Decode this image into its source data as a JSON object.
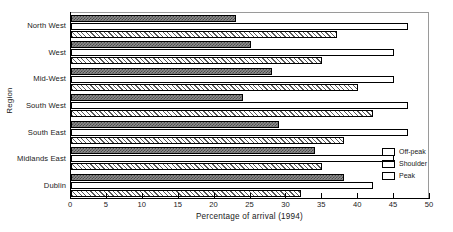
{
  "chart_data": {
    "type": "bar",
    "orientation": "horizontal",
    "title": "",
    "xlabel": "Percentage of arrival (1994)",
    "ylabel": "Region",
    "xlim": [
      0,
      50
    ],
    "xticks": [
      0,
      5,
      10,
      15,
      20,
      25,
      30,
      35,
      40,
      45,
      50
    ],
    "grid": false,
    "legend_position": "bottom-right",
    "categories": [
      "North West",
      "West",
      "Mid-West",
      "South West",
      "South East",
      "Midlands East",
      "Dublin"
    ],
    "series": [
      {
        "name": "Off-peak",
        "fill": "dark-checker",
        "values": [
          23,
          25,
          28,
          24,
          29,
          34,
          38
        ]
      },
      {
        "name": "Shoulder",
        "fill": "white",
        "values": [
          47,
          45,
          45,
          47,
          47,
          45,
          42
        ]
      },
      {
        "name": "Peak",
        "fill": "diagonal-hatch",
        "values": [
          37,
          35,
          40,
          42,
          38,
          35,
          32
        ]
      }
    ]
  },
  "legend": {
    "items": [
      {
        "label": "Off-peak"
      },
      {
        "label": "Shoulder"
      },
      {
        "label": "Peak"
      }
    ]
  },
  "colors": {
    "offpeak": "#4a4a4a",
    "shoulder": "#ffffff",
    "peak": "#5a5a5a",
    "axis": "#000000",
    "background": "#ffffff"
  }
}
